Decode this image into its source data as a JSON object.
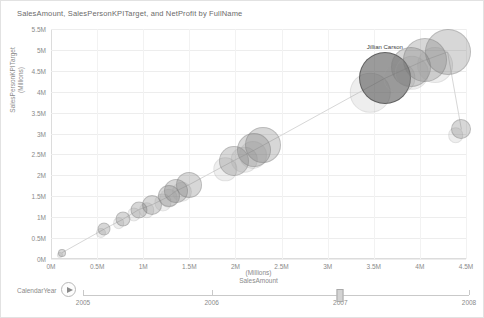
{
  "chart_title": "SalesAmount, SalesPersonKPITarget, and NetProfit by FullName",
  "axes": {
    "y_title_line1": "SalesPersonKPITarget",
    "y_title_line2": "(Millions)",
    "x_title_line1": "(Millions)",
    "x_title_line2": "SalesAmount",
    "y_ticks": [
      "0M",
      "0.5M",
      "1M",
      "1.5M",
      "2M",
      "2.5M",
      "3M",
      "3.5M",
      "4M",
      "4.5M",
      "5M",
      "5.5M"
    ],
    "x_ticks": [
      "0M",
      "0.5M",
      "1M",
      "1.5M",
      "2M",
      "2.5M",
      "3M",
      "3.5M",
      "4M",
      "4.5M"
    ]
  },
  "annotation": {
    "label": "Jillian Carson"
  },
  "play_axis": {
    "label": "CalendarYear",
    "play_icon": "play-icon",
    "ticks": [
      "2005",
      "2006",
      "2007",
      "2008"
    ],
    "current_value": "2007"
  },
  "colors": {
    "bubble_fill": "#6e6e6e",
    "bubble_highlight": "#484848",
    "grid": "#ededed",
    "axis_text": "#8a8a8a",
    "title_text": "#6b6b6b"
  },
  "chart_data": {
    "type": "scatter",
    "title": "SalesAmount, SalesPersonKPITarget, and NetProfit by FullName",
    "xlabel": "SalesAmount (Millions)",
    "ylabel": "SalesPersonKPITarget (Millions)",
    "xlim": [
      0,
      4.5
    ],
    "ylim": [
      0,
      5.5
    ],
    "grid": true,
    "legend": "none",
    "size_measure": "NetProfit",
    "animation_axis": "CalendarYear",
    "animation_frame": "2007",
    "points": [
      {
        "name": "",
        "x": 0.12,
        "y": 0.15,
        "size": 8
      },
      {
        "name": "",
        "x": 0.58,
        "y": 0.72,
        "size": 13
      },
      {
        "name": "",
        "x": 0.78,
        "y": 0.95,
        "size": 15
      },
      {
        "name": "",
        "x": 0.95,
        "y": 1.18,
        "size": 17
      },
      {
        "name": "",
        "x": 1.1,
        "y": 1.3,
        "size": 20
      },
      {
        "name": "",
        "x": 1.28,
        "y": 1.5,
        "size": 22
      },
      {
        "name": "",
        "x": 1.35,
        "y": 1.62,
        "size": 24
      },
      {
        "name": "",
        "x": 1.5,
        "y": 1.78,
        "size": 26
      },
      {
        "name": "",
        "x": 1.98,
        "y": 2.35,
        "size": 30
      },
      {
        "name": "",
        "x": 2.2,
        "y": 2.6,
        "size": 34
      },
      {
        "name": "",
        "x": 2.3,
        "y": 2.72,
        "size": 36
      },
      {
        "name": "Jillian Carson",
        "x": 3.62,
        "y": 4.32,
        "size": 52
      },
      {
        "name": "",
        "x": 3.9,
        "y": 4.6,
        "size": 40
      },
      {
        "name": "",
        "x": 4.05,
        "y": 4.75,
        "size": 44
      },
      {
        "name": "",
        "x": 4.3,
        "y": 4.95,
        "size": 46
      },
      {
        "name": "",
        "x": 4.45,
        "y": 3.1,
        "size": 20
      }
    ]
  }
}
